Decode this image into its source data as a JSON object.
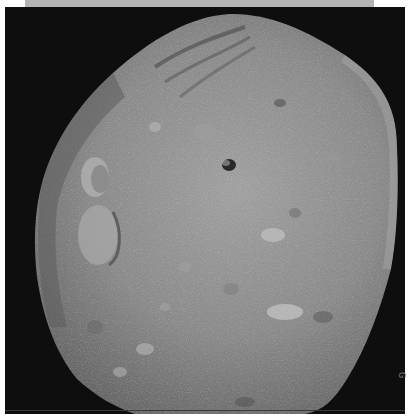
{
  "figure": {
    "top_bar_color": "#b4b4b4",
    "background_color": "#0e0e0e",
    "surface_color": "#8e8e8e"
  },
  "edge_caption": {
    "text": "G"
  }
}
